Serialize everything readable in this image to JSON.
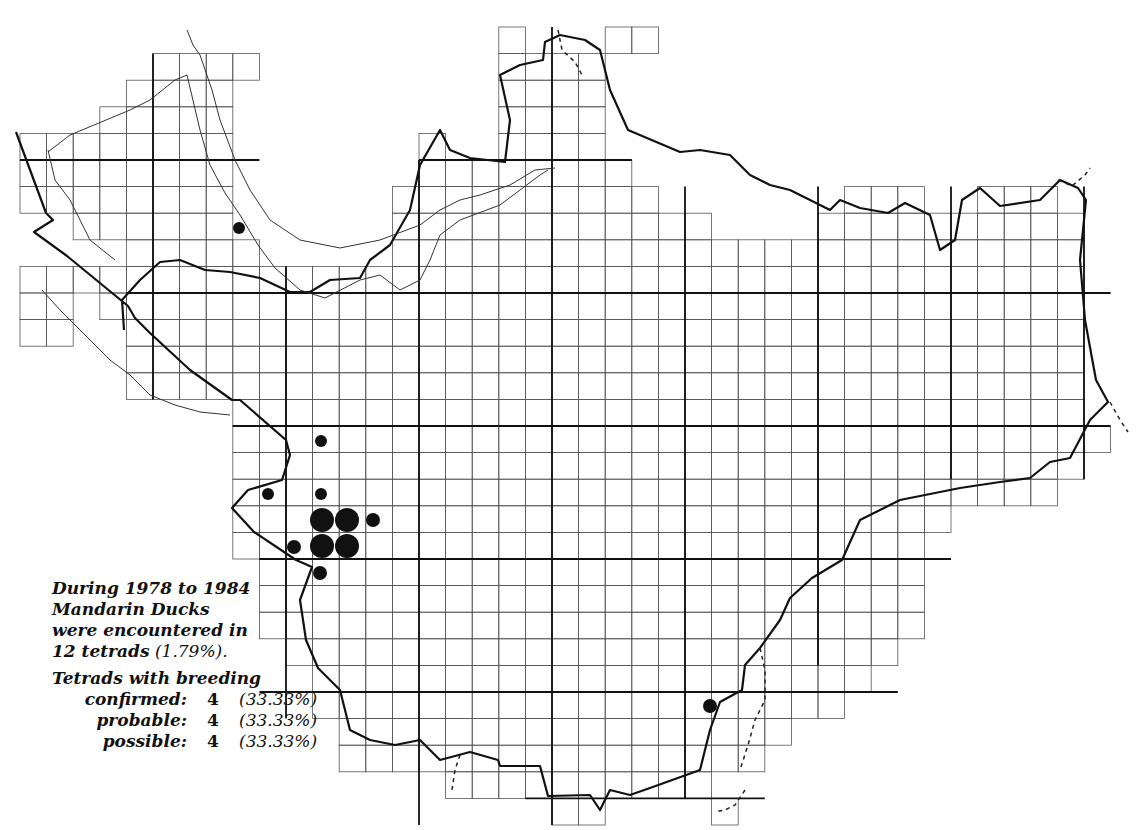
{
  "map": {
    "title": "Mandarin Duck tetrad distribution map",
    "grid": {
      "origin_x": 20,
      "origin_y": 27,
      "cell_px": 26.6,
      "major_every": 5
    },
    "colors": {
      "ink": "#111111",
      "grid": "#444444",
      "paper": "#ffffff"
    },
    "records": [
      {
        "x": 239,
        "y": 228,
        "status": "possible"
      },
      {
        "x": 321,
        "y": 441,
        "status": "possible"
      },
      {
        "x": 268,
        "y": 494,
        "status": "possible"
      },
      {
        "x": 321,
        "y": 494,
        "status": "possible"
      },
      {
        "x": 322,
        "y": 520,
        "status": "confirmed"
      },
      {
        "x": 347,
        "y": 520,
        "status": "confirmed"
      },
      {
        "x": 373,
        "y": 520,
        "status": "probable"
      },
      {
        "x": 294,
        "y": 547,
        "status": "probable"
      },
      {
        "x": 322,
        "y": 546,
        "status": "confirmed"
      },
      {
        "x": 347,
        "y": 546,
        "status": "confirmed"
      },
      {
        "x": 320,
        "y": 573,
        "status": "probable"
      },
      {
        "x": 710,
        "y": 706,
        "status": "probable"
      }
    ],
    "dot_radius": {
      "confirmed": 12,
      "probable": 7,
      "possible": 6
    }
  },
  "legend": {
    "line1": "During 1978 to 1984",
    "line2": "Mandarin Ducks",
    "line3": "were encountered in",
    "line4_bold": "12 tetrads",
    "line4_plain": "(1.79%).",
    "heading": "Tetrads with breeding",
    "rows": [
      {
        "label": "confirmed:",
        "count": "4",
        "pct": "(33.33%)"
      },
      {
        "label": "probable:",
        "count": "4",
        "pct": "(33.33%)"
      },
      {
        "label": "possible:",
        "count": "4",
        "pct": "(33.33%)"
      }
    ]
  }
}
